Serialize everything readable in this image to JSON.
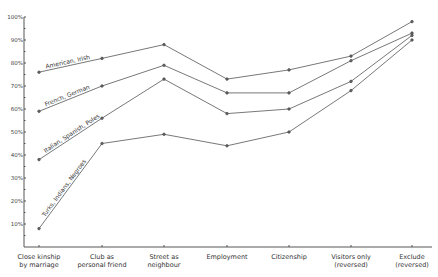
{
  "chart_data": {
    "type": "line",
    "title": "",
    "xlabel": "",
    "ylabel": "",
    "ylim": [
      0,
      100
    ],
    "y_ticks": [
      "10%",
      "20%",
      "30%",
      "40%",
      "50%",
      "60%",
      "70%",
      "80%",
      "90%",
      "100%"
    ],
    "grid": false,
    "legend_position": "inline labels along lines",
    "categories": [
      [
        "Close kinship",
        "by marriage"
      ],
      [
        "Club as",
        "personal friend"
      ],
      [
        "Street as",
        "neighbour"
      ],
      [
        "Employment"
      ],
      [
        "Citizenship"
      ],
      [
        "Visitors only",
        "(reversed)"
      ],
      [
        "Exclude",
        "(reversed)"
      ]
    ],
    "series": [
      {
        "name": "American, Irish",
        "values": [
          76,
          82,
          88,
          73,
          77,
          83,
          98
        ]
      },
      {
        "name": "French, German",
        "values": [
          59,
          70,
          79,
          67,
          67,
          81,
          93
        ]
      },
      {
        "name": "Italian, Spanish, Poles",
        "values": [
          38,
          56,
          73,
          58,
          60,
          72,
          92
        ]
      },
      {
        "name": "Turks, Indians, Negroes",
        "values": [
          8,
          45,
          49,
          44,
          50,
          68,
          90
        ]
      }
    ]
  }
}
